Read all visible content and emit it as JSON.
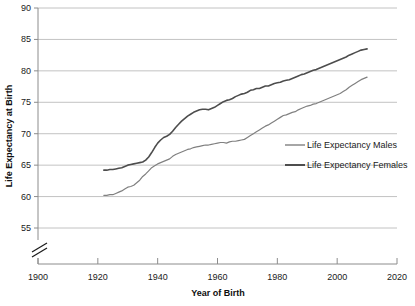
{
  "chart_data": {
    "type": "line",
    "title": "",
    "xlabel": "Year of Birth",
    "ylabel": "Life Expectancy at Birth",
    "xlim": [
      1900,
      2020
    ],
    "ylim": [
      55,
      90
    ],
    "xticks": [
      1900,
      1920,
      1940,
      1960,
      1980,
      2000,
      2020
    ],
    "yticks": [
      55,
      60,
      65,
      70,
      75,
      80,
      85,
      90
    ],
    "grid": "horizontal",
    "axis_break": true,
    "legend_position": "center-right",
    "series": [
      {
        "name": "Life Expectancy Males",
        "color": "#808080",
        "x": [
          1922,
          1923,
          1924,
          1925,
          1926,
          1927,
          1928,
          1929,
          1930,
          1931,
          1932,
          1933,
          1934,
          1935,
          1936,
          1937,
          1938,
          1939,
          1940,
          1941,
          1942,
          1943,
          1944,
          1945,
          1946,
          1947,
          1948,
          1949,
          1950,
          1951,
          1952,
          1953,
          1954,
          1955,
          1956,
          1957,
          1958,
          1959,
          1960,
          1961,
          1962,
          1963,
          1964,
          1965,
          1966,
          1967,
          1968,
          1969,
          1970,
          1971,
          1972,
          1973,
          1974,
          1975,
          1976,
          1977,
          1978,
          1979,
          1980,
          1981,
          1982,
          1983,
          1984,
          1985,
          1986,
          1987,
          1988,
          1989,
          1990,
          1991,
          1992,
          1993,
          1994,
          1995,
          1996,
          1997,
          1998,
          1999,
          2000,
          2001,
          2002,
          2003,
          2004,
          2005,
          2006,
          2007,
          2008,
          2009,
          2010
        ],
        "values": [
          60.2,
          60.2,
          60.3,
          60.3,
          60.5,
          60.7,
          60.9,
          61.2,
          61.5,
          61.6,
          61.8,
          62.2,
          62.6,
          63.2,
          63.6,
          64.1,
          64.6,
          64.9,
          65.2,
          65.4,
          65.6,
          65.8,
          66.0,
          66.4,
          66.7,
          66.9,
          67.1,
          67.3,
          67.5,
          67.6,
          67.8,
          67.9,
          68.0,
          68.1,
          68.2,
          68.2,
          68.3,
          68.4,
          68.5,
          68.6,
          68.6,
          68.5,
          68.7,
          68.8,
          68.8,
          68.9,
          69.0,
          69.1,
          69.4,
          69.7,
          70.0,
          70.3,
          70.6,
          70.9,
          71.2,
          71.4,
          71.7,
          72.0,
          72.3,
          72.6,
          72.9,
          73.0,
          73.2,
          73.4,
          73.5,
          73.8,
          74.0,
          74.2,
          74.4,
          74.5,
          74.7,
          74.8,
          75.0,
          75.2,
          75.4,
          75.6,
          75.8,
          76.0,
          76.2,
          76.4,
          76.7,
          77.0,
          77.4,
          77.7,
          78.0,
          78.3,
          78.6,
          78.8,
          79.0
        ]
      },
      {
        "name": "Life Expectancy Females",
        "color": "#4d4d4d",
        "x": [
          1922,
          1923,
          1924,
          1925,
          1926,
          1927,
          1928,
          1929,
          1930,
          1931,
          1932,
          1933,
          1934,
          1935,
          1936,
          1937,
          1938,
          1939,
          1940,
          1941,
          1942,
          1943,
          1944,
          1945,
          1946,
          1947,
          1948,
          1949,
          1950,
          1951,
          1952,
          1953,
          1954,
          1955,
          1956,
          1957,
          1958,
          1959,
          1960,
          1961,
          1962,
          1963,
          1964,
          1965,
          1966,
          1967,
          1968,
          1969,
          1970,
          1971,
          1972,
          1973,
          1974,
          1975,
          1976,
          1977,
          1978,
          1979,
          1980,
          1981,
          1982,
          1983,
          1984,
          1985,
          1986,
          1987,
          1988,
          1989,
          1990,
          1991,
          1992,
          1993,
          1994,
          1995,
          1996,
          1997,
          1998,
          1999,
          2000,
          2001,
          2002,
          2003,
          2004,
          2005,
          2006,
          2007,
          2008,
          2009,
          2010
        ],
        "values": [
          64.2,
          64.2,
          64.3,
          64.3,
          64.4,
          64.5,
          64.6,
          64.8,
          65.0,
          65.1,
          65.2,
          65.3,
          65.4,
          65.5,
          65.8,
          66.3,
          67.0,
          67.8,
          68.5,
          69.0,
          69.4,
          69.6,
          69.9,
          70.4,
          71.0,
          71.5,
          72.0,
          72.4,
          72.8,
          73.1,
          73.4,
          73.6,
          73.8,
          73.9,
          73.9,
          73.8,
          74.0,
          74.2,
          74.5,
          74.8,
          75.1,
          75.3,
          75.4,
          75.6,
          75.9,
          76.1,
          76.3,
          76.4,
          76.6,
          76.9,
          77.0,
          77.2,
          77.2,
          77.4,
          77.6,
          77.6,
          77.8,
          78.0,
          78.1,
          78.2,
          78.4,
          78.5,
          78.6,
          78.8,
          79.0,
          79.2,
          79.4,
          79.5,
          79.7,
          79.9,
          80.1,
          80.2,
          80.4,
          80.6,
          80.8,
          81.0,
          81.2,
          81.4,
          81.6,
          81.8,
          82.0,
          82.2,
          82.5,
          82.7,
          82.9,
          83.1,
          83.3,
          83.4,
          83.5
        ]
      }
    ],
    "legend": [
      {
        "label": "Life Expectancy Males",
        "color": "#808080"
      },
      {
        "label": "Life Expectancy Females",
        "color": "#4d4d4d"
      }
    ]
  }
}
